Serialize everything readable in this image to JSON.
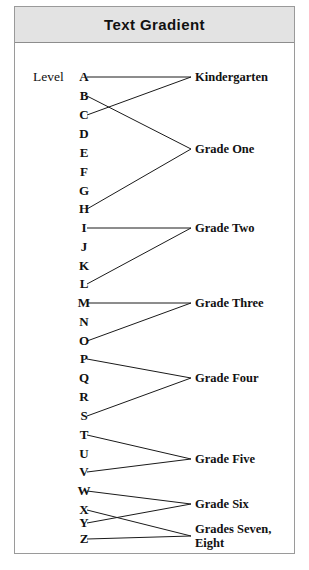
{
  "figure": {
    "title": "Text Gradient",
    "axis_caption": "Level"
  },
  "levels": [
    {
      "letter": "A",
      "y": 70
    },
    {
      "letter": "B",
      "y": 89
    },
    {
      "letter": "C",
      "y": 108
    },
    {
      "letter": "D",
      "y": 127
    },
    {
      "letter": "E",
      "y": 146
    },
    {
      "letter": "F",
      "y": 165
    },
    {
      "letter": "G",
      "y": 184
    },
    {
      "letter": "H",
      "y": 202
    },
    {
      "letter": "I",
      "y": 221
    },
    {
      "letter": "J",
      "y": 240
    },
    {
      "letter": "K",
      "y": 259
    },
    {
      "letter": "L",
      "y": 277
    },
    {
      "letter": "M",
      "y": 296
    },
    {
      "letter": "N",
      "y": 315
    },
    {
      "letter": "O",
      "y": 334
    },
    {
      "letter": "P",
      "y": 352
    },
    {
      "letter": "Q",
      "y": 371
    },
    {
      "letter": "R",
      "y": 390
    },
    {
      "letter": "S",
      "y": 409
    },
    {
      "letter": "T",
      "y": 428
    },
    {
      "letter": "U",
      "y": 447
    },
    {
      "letter": "V",
      "y": 465
    },
    {
      "letter": "W",
      "y": 484
    },
    {
      "letter": "X",
      "y": 503
    },
    {
      "letter": "Y",
      "y": 516
    },
    {
      "letter": "Z",
      "y": 532
    }
  ],
  "grades": [
    {
      "label": "Kindergarten",
      "y": 70,
      "levels": [
        "A",
        "C"
      ]
    },
    {
      "label": "Grade One",
      "y": 142,
      "levels": [
        "B",
        "H"
      ]
    },
    {
      "label": "Grade Two",
      "y": 221,
      "levels": [
        "I",
        "L"
      ]
    },
    {
      "label": "Grade Three",
      "y": 296,
      "levels": [
        "M",
        "O"
      ]
    },
    {
      "label": "Grade Four",
      "y": 371,
      "levels": [
        "P",
        "S"
      ]
    },
    {
      "label": "Grade Five",
      "y": 452,
      "levels": [
        "T",
        "V"
      ]
    },
    {
      "label": "Grade Six",
      "y": 497,
      "levels": [
        "W",
        "Y"
      ]
    },
    {
      "label": "Grades Seven,\nEight",
      "y": 529,
      "levels": [
        "X",
        "Z"
      ]
    }
  ],
  "geometry": {
    "letter_x": 62,
    "line_start_x": 72,
    "vertex_x": 176,
    "label_x": 180,
    "caption_x": 18,
    "caption_y": 70
  },
  "colors": {
    "title_bar": "#e3e3e3",
    "border": "#9a9a9a",
    "line": "#1a1a1a",
    "text": "#111111"
  }
}
